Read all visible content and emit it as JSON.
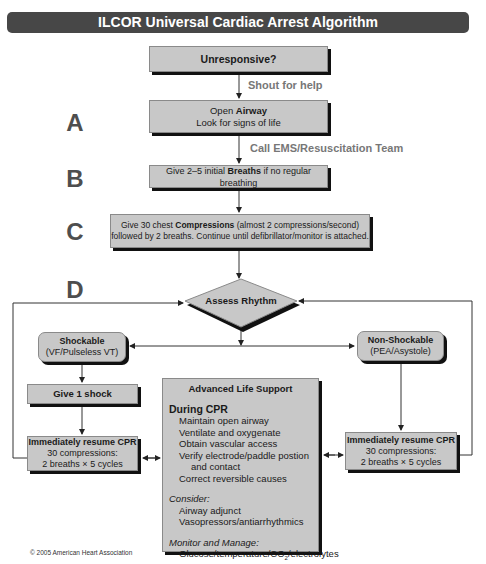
{
  "title": "ILCOR Universal Cardiac Arrest Algorithm",
  "colors": {
    "title_bg": "#474747",
    "box_fill": "#c8c8c8",
    "shadow": "#111111",
    "letter": "#4e4e4e",
    "note": "#777777"
  },
  "steps": {
    "unresponsive": "Unresponsive?",
    "shout": "Shout for help",
    "airway": {
      "pre": "Open ",
      "bold": "Airway",
      "line2": "Look for signs of life"
    },
    "call_ems": "Call EMS/Resuscitation Team",
    "breaths": {
      "pre": "Give 2–5 initial ",
      "bold": "Breaths",
      "post": " if no regular breathing"
    },
    "compressions": {
      "pre": "Give 30 chest ",
      "bold": "Compressions",
      "post": " (almost 2 compressions/second)",
      "line2": "followed by 2 breaths. Continue until defibrillator/monitor is attached."
    },
    "assess": "Assess Rhythm"
  },
  "letters": {
    "a": "A",
    "b": "B",
    "c": "C",
    "d": "D"
  },
  "shockable": {
    "title": "Shockable",
    "sub": "(VF/Pulseless VT)",
    "shock": "Give 1 shock",
    "cpr_title": "Immediately resume CPR",
    "cpr_line1": "30 compressions:",
    "cpr_line2": "2 breaths × 5 cycles"
  },
  "non_shockable": {
    "title": "Non-Shockable",
    "sub": "(PEA/Asystole)",
    "cpr_title": "Immediately resume CPR",
    "cpr_line1": "30 compressions:",
    "cpr_line2": "2 breaths × 5 cycles"
  },
  "als": {
    "title": "Advanced Life Support",
    "during_cpr": "During CPR",
    "during_items": [
      "Maintain open airway",
      "Ventilate and oxygenate",
      "Obtain vascular access",
      "Verify electrode/paddle postion",
      "and contact",
      "Correct reversible causes"
    ],
    "consider": "Consider:",
    "consider_items": [
      "Airway adjunct",
      "Vasopressors/antiarrhythmics"
    ],
    "monitor": "Monitor and Manage:",
    "monitor_pre": "Glucose/temperature/CO",
    "monitor_sub": "2",
    "monitor_post": "/electrolytes"
  },
  "copyright": "© 2005 American Heart Association"
}
